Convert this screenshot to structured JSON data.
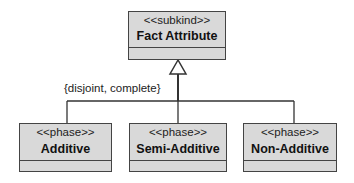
{
  "diagram": {
    "type": "UML class diagram (generalization set)",
    "superclass": {
      "stereotype": "<<subkind>>",
      "name": "Fact Attribute"
    },
    "constraint": "{disjoint, complete}",
    "subclasses": [
      {
        "stereotype": "<<phase>>",
        "name": "Additive"
      },
      {
        "stereotype": "<<phase>>",
        "name": "Semi-Additive"
      },
      {
        "stereotype": "<<phase>>",
        "name": "Non-Additive"
      }
    ],
    "colors": {
      "box_fill": "#d9d9d9",
      "stroke": "#444444"
    }
  }
}
